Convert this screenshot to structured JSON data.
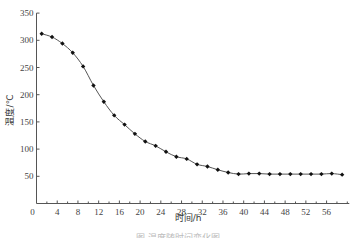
{
  "chart_data": {
    "type": "line",
    "title": "",
    "xlabel": "时间/h",
    "ylabel": "温度/℃",
    "caption": "图    温度随时间变化图",
    "xlim": [
      0,
      60
    ],
    "ylim": [
      0,
      350
    ],
    "x_ticks": [
      0,
      4,
      8,
      12,
      16,
      20,
      24,
      28,
      32,
      36,
      40,
      44,
      48,
      52,
      56
    ],
    "x_minor_step": 2,
    "y_ticks": [
      50,
      100,
      150,
      200,
      250,
      300,
      350
    ],
    "grid": false,
    "legend": null,
    "series": [
      {
        "name": "温度",
        "marker": "diamond",
        "color": "#222222",
        "x": [
          1,
          3,
          5,
          7,
          9,
          11,
          13,
          15,
          17,
          19,
          21,
          23,
          25,
          27,
          29,
          31,
          33,
          35,
          37,
          39,
          41,
          43,
          45,
          47,
          49,
          51,
          53,
          55,
          57,
          59
        ],
        "values": [
          312,
          306,
          294,
          277,
          252,
          217,
          187,
          162,
          145,
          128,
          114,
          106,
          95,
          86,
          82,
          72,
          68,
          62,
          57,
          54,
          55,
          55,
          54,
          54,
          54,
          54,
          54,
          54,
          55,
          53
        ]
      }
    ]
  },
  "layout": {
    "axis_color": "#555555",
    "line_color": "#555555",
    "marker_color": "#111111"
  }
}
